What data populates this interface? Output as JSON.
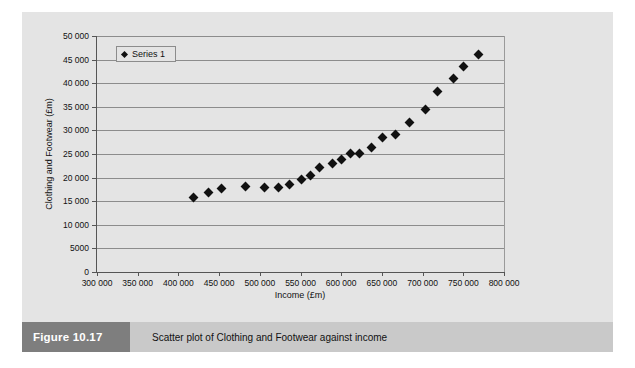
{
  "figure": {
    "badge_label": "Figure 10.17",
    "caption": "Scatter plot of Clothing and Footwear against income"
  },
  "colors": {
    "panel_background": "#e4e4e4",
    "gridline": "#8c8c8c",
    "axis": "#555555",
    "marker": "#111111",
    "badge_background": "#7e7e7e",
    "caption_background": "#c9c9c9"
  },
  "chart_data": {
    "type": "scatter",
    "title": "",
    "xlabel": "Income (£m)",
    "ylabel": "Clothing and Footwear (£m)",
    "xlim": [
      300000,
      800000
    ],
    "ylim": [
      0,
      50000
    ],
    "grid": true,
    "legend_position": "top-left",
    "xticks": [
      300000,
      350000,
      400000,
      450000,
      500000,
      550000,
      600000,
      650000,
      700000,
      750000,
      800000
    ],
    "xticklabels": [
      "300 000",
      "350 000",
      "400 000",
      "450 000",
      "500 000",
      "550 000",
      "600 000",
      "650 000",
      "700 000",
      "750 000",
      "800 000"
    ],
    "yticks": [
      0,
      5000,
      10000,
      15000,
      20000,
      25000,
      30000,
      35000,
      40000,
      45000,
      50000
    ],
    "yticklabels": [
      "0",
      "5000",
      "10 000",
      "15 000",
      "20 000",
      "25 000",
      "30 000",
      "35 000",
      "40 000",
      "45 000",
      "50 000"
    ],
    "series": [
      {
        "name": "Series 1",
        "marker": "diamond",
        "color": "#111111",
        "points": [
          [
            419000,
            15800
          ],
          [
            437000,
            16900
          ],
          [
            453000,
            17600
          ],
          [
            483000,
            18100
          ],
          [
            506000,
            17900
          ],
          [
            523000,
            18000
          ],
          [
            537000,
            18600
          ],
          [
            551000,
            19600
          ],
          [
            562000,
            20400
          ],
          [
            573000,
            22100
          ],
          [
            589000,
            23000
          ],
          [
            600000,
            23900
          ],
          [
            612000,
            25100
          ],
          [
            623000,
            25200
          ],
          [
            637000,
            26400
          ],
          [
            651000,
            28600
          ],
          [
            667000,
            29200
          ],
          [
            684000,
            31600
          ],
          [
            703000,
            34500
          ],
          [
            718000,
            38200
          ],
          [
            738000,
            41100
          ],
          [
            750000,
            43600
          ],
          [
            769000,
            46100
          ]
        ]
      }
    ]
  }
}
